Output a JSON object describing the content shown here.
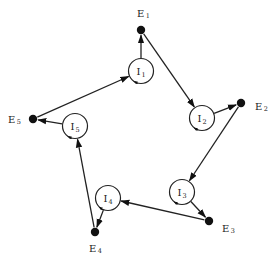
{
  "diagram": {
    "type": "cycle-graph",
    "external_nodes": [
      {
        "id": "E1",
        "letter": "E",
        "sub": "1"
      },
      {
        "id": "E2",
        "letter": "E",
        "sub": "2"
      },
      {
        "id": "E3",
        "letter": "E",
        "sub": "3"
      },
      {
        "id": "E4",
        "letter": "E",
        "sub": "4"
      },
      {
        "id": "E5",
        "letter": "E",
        "sub": "5"
      }
    ],
    "internal_nodes": [
      {
        "id": "I1",
        "letter": "I",
        "sub": "1"
      },
      {
        "id": "I2",
        "letter": "I",
        "sub": "2"
      },
      {
        "id": "I3",
        "letter": "I",
        "sub": "3"
      },
      {
        "id": "I4",
        "letter": "I",
        "sub": "4"
      },
      {
        "id": "I5",
        "letter": "I",
        "sub": "5"
      }
    ],
    "edges": [
      {
        "from": "I1",
        "to": "E1"
      },
      {
        "from": "E1",
        "to": "I2"
      },
      {
        "from": "I2",
        "to": "E2"
      },
      {
        "from": "E2",
        "to": "I3"
      },
      {
        "from": "I3",
        "to": "E3"
      },
      {
        "from": "E3",
        "to": "I4"
      },
      {
        "from": "I4",
        "to": "E4"
      },
      {
        "from": "E4",
        "to": "I5"
      },
      {
        "from": "I5",
        "to": "E5"
      },
      {
        "from": "E5",
        "to": "I1"
      }
    ],
    "self_loops": [
      "I1",
      "I2",
      "I3",
      "I4",
      "I5"
    ]
  }
}
